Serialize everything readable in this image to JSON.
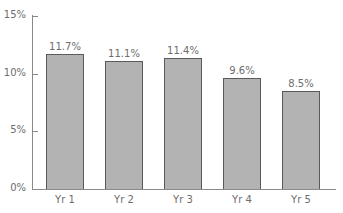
{
  "chart_data": {
    "type": "bar",
    "title": "",
    "xlabel": "",
    "ylabel": "",
    "categories": [
      "Yr 1",
      "Yr 2",
      "Yr 3",
      "Yr 4",
      "Yr 5"
    ],
    "values": [
      11.7,
      11.1,
      11.4,
      9.6,
      8.5
    ],
    "data_labels": [
      "11.7%",
      "11.1%",
      "11.4%",
      "9.6%",
      "8.5%"
    ],
    "y_ticks": [
      "0%",
      "5%",
      "10%",
      "15%"
    ],
    "y_tick_values": [
      0,
      5,
      10,
      15
    ],
    "ylim": [
      0,
      15
    ],
    "grid": false,
    "legend": null,
    "colors": {
      "bar_fill": "#b3b3b3",
      "bar_edge": "#5a5a5a",
      "axis": "#8a8a8a",
      "text": "#6d6d6d"
    }
  }
}
